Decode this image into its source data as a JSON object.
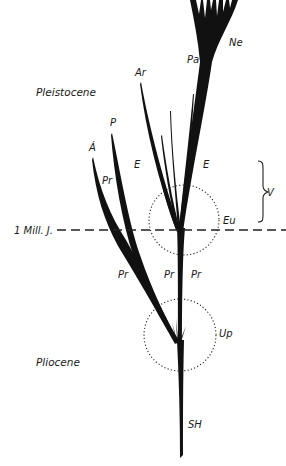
{
  "diagram": {
    "eras": {
      "upper": "Pleistocene",
      "lower": "Pliocene"
    },
    "time_marker": "1 Mill. J.",
    "branch_labels": {
      "ne": "Ne",
      "pa": "Pa",
      "ar": "Ar",
      "p": "P",
      "a": "Á",
      "e_left": "E",
      "e_right": "E",
      "pr_upper": "Pr",
      "pr_lower_left": "Pr",
      "pr_lower_mid": "Pr",
      "pr_lower_right": "Pr",
      "sh": "SH"
    },
    "nodes": {
      "eu": "Eu",
      "up": "Up"
    },
    "bracket_label": "V"
  }
}
